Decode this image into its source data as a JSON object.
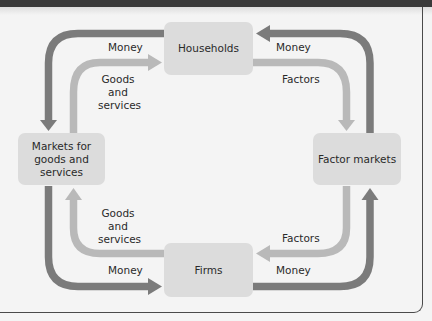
{
  "diagram": {
    "type": "circular-flow",
    "colors": {
      "money_flow": "#7b7b7b",
      "goods_factor_flow": "#b9b9b9",
      "node_fill": "#dcdcdc",
      "background": "#f4f4f4",
      "frame": "#4a4a4a"
    },
    "nodes": {
      "households": "Households",
      "firms": "Firms",
      "goods_markets": "Markets for goods and services",
      "factor_markets": "Factor markets"
    },
    "labels": {
      "top_left_money": "Money",
      "top_left_goods": "Goods\nand\nservices",
      "top_right_money": "Money",
      "top_right_factors": "Factors",
      "bottom_left_goods": "Goods\nand\nservices",
      "bottom_left_money": "Money",
      "bottom_right_factors": "Factors",
      "bottom_right_money": "Money"
    },
    "flows": [
      {
        "from": "Households",
        "to": "Markets for goods and services",
        "label": "Money",
        "kind": "money"
      },
      {
        "from": "Markets for goods and services",
        "to": "Households",
        "label": "Goods and services",
        "kind": "real"
      },
      {
        "from": "Factor markets",
        "to": "Households",
        "label": "Money",
        "kind": "money"
      },
      {
        "from": "Households",
        "to": "Factor markets",
        "label": "Factors",
        "kind": "real"
      },
      {
        "from": "Markets for goods and services",
        "to": "Firms",
        "label": "Money",
        "kind": "money"
      },
      {
        "from": "Firms",
        "to": "Markets for goods and services",
        "label": "Goods and services",
        "kind": "real"
      },
      {
        "from": "Firms",
        "to": "Factor markets",
        "label": "Money",
        "kind": "money"
      },
      {
        "from": "Factor markets",
        "to": "Firms",
        "label": "Factors",
        "kind": "real"
      }
    ]
  }
}
